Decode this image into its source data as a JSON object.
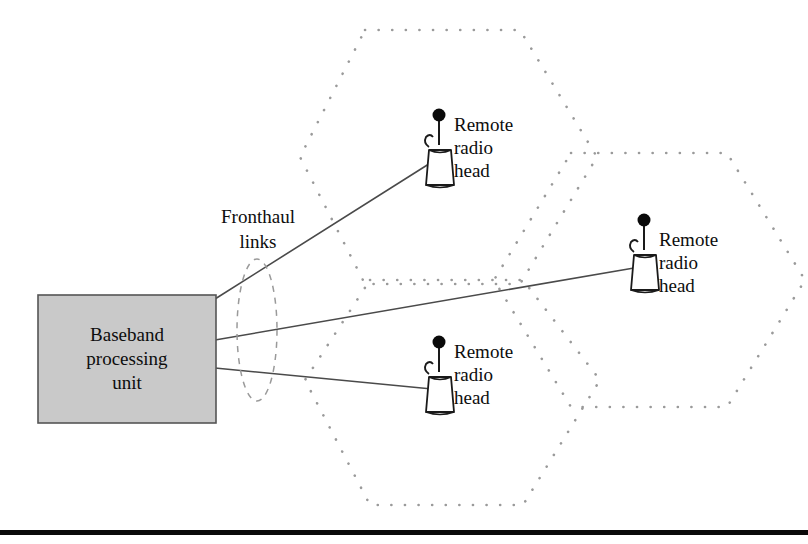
{
  "figure": {
    "background_color": "#ffffff",
    "line_color": "#444444",
    "cell_dot_color": "#9a9a9a",
    "box_fill_color": "#c9c9c9",
    "box_border_color": "#555555",
    "rule_color": "#0a0a0a"
  },
  "baseband_unit": {
    "label_line1": "Baseband",
    "label_line2": "processing",
    "label_line3": "unit"
  },
  "fronthaul": {
    "label_line1": "Fronthaul",
    "label_line2": "links"
  },
  "radio_heads": [
    {
      "id": "rrh-top",
      "label_line1": "Remote",
      "label_line2": "radio",
      "label_line3": "head"
    },
    {
      "id": "rrh-right",
      "label_line1": "Remote",
      "label_line2": "radio",
      "label_line3": "head"
    },
    {
      "id": "rrh-bottom",
      "label_line1": "Remote",
      "label_line2": "radio",
      "label_line3": "head"
    }
  ]
}
